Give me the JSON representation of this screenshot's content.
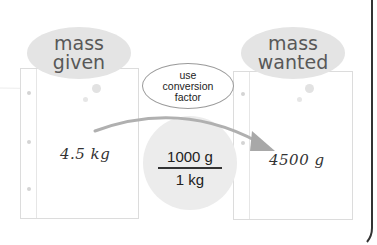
{
  "diagram": {
    "type": "unit-conversion-flow",
    "source": {
      "label_line1": "mass",
      "label_line2": "given",
      "value": "4.5 kg"
    },
    "step": {
      "label_line1": "use",
      "label_line2": "conversion",
      "label_line3": "factor"
    },
    "conversion_factor": {
      "numerator": "1000 g",
      "denominator": "1 kg"
    },
    "target": {
      "label_line1": "mass",
      "label_line2": "wanted",
      "value": "4500 g"
    },
    "colors": {
      "bubble_fill": "#e4e4e4",
      "bubble_text": "#585858",
      "circle_fill": "#ececec",
      "arrow": "#a8a8a8",
      "bracket": "#333333",
      "card_border": "#dcdcdc"
    }
  }
}
